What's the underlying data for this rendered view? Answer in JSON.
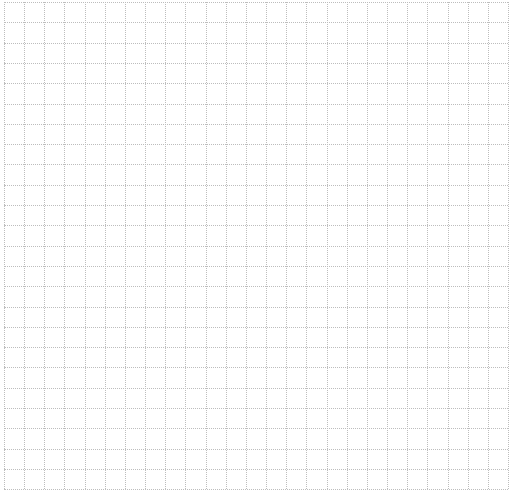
{
  "grid": {
    "columns": 25,
    "rows": 24,
    "cell_width": 20.16,
    "cell_height": 20.3,
    "line_color": "#bdbdbd",
    "background": "#ffffff",
    "line_style": "dotted"
  }
}
